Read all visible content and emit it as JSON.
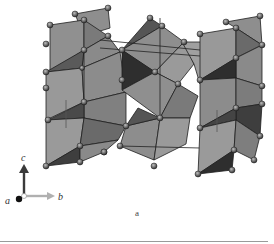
{
  "figure": {
    "panel_label": "a",
    "axes": {
      "c_label": "c",
      "b_label": "b",
      "a_label": "a"
    },
    "colors": {
      "polyhedron_light": "#9a9a9a",
      "polyhedron_mid": "#7a7a7a",
      "polyhedron_dark": "#3c3c3c",
      "edge": "#1e1e1e",
      "atom": "#5e5e5e",
      "c_arrow": "#3a3a3a",
      "b_arrow": "#b0b0b0",
      "a_atom": "#111111"
    }
  }
}
